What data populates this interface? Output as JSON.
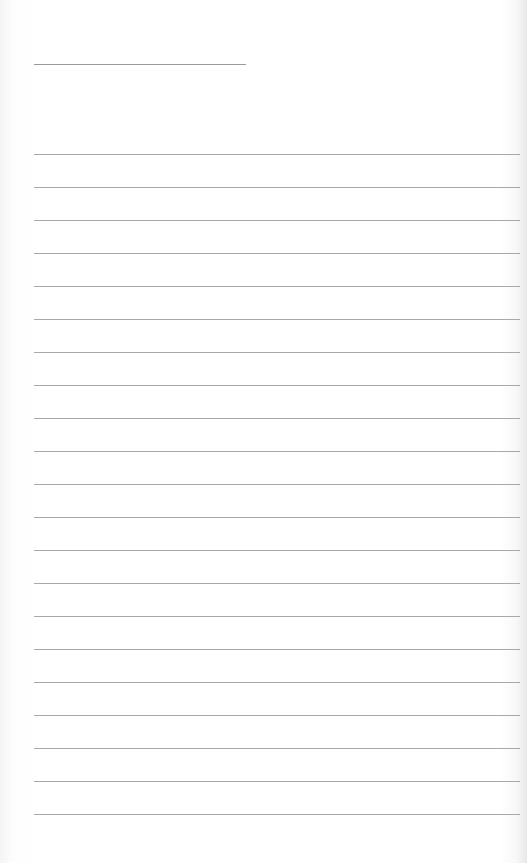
{
  "page": {
    "type": "lined-paper",
    "background_color": "#ffffff",
    "line_color": "#a8a8a8"
  },
  "header_line": {
    "x": 34,
    "y": 64,
    "width": 212
  },
  "rules": {
    "count": 21,
    "x": 34,
    "width": 486,
    "first_y": 154,
    "spacing": 33
  }
}
